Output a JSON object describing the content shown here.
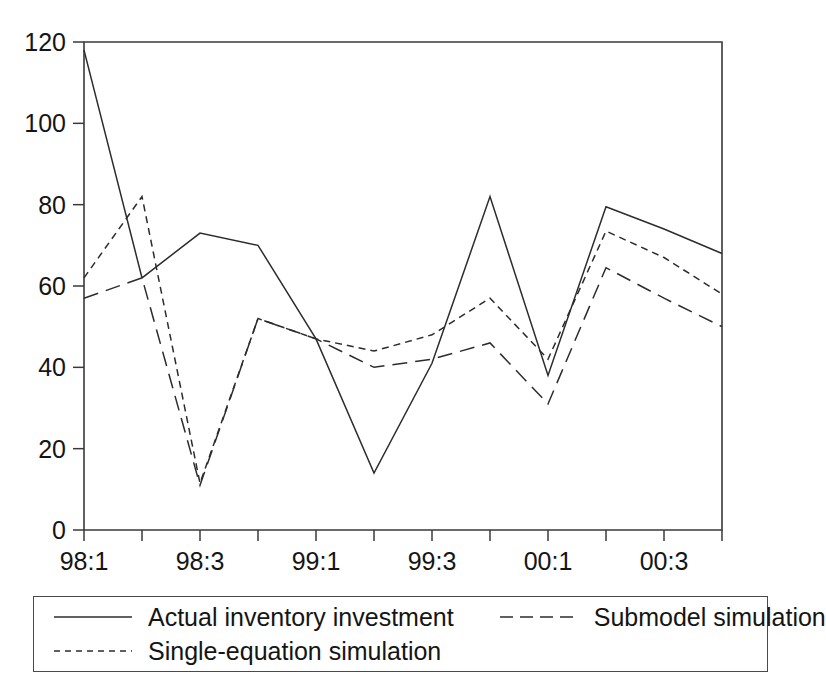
{
  "chart_data": {
    "type": "line",
    "title": "",
    "subtitle": "",
    "xlabel": "",
    "ylabel": "",
    "categories": [
      "98:1",
      "98:2",
      "98:3",
      "98:4",
      "99:1",
      "99:2",
      "99:3",
      "99:4",
      "00:1",
      "00:2",
      "00:3",
      "00:4"
    ],
    "x_tick_labels": [
      "98:1",
      "98:3",
      "99:1",
      "99:3",
      "00:1",
      "00:3"
    ],
    "x_tick_label_indices": [
      0,
      2,
      4,
      6,
      8,
      10
    ],
    "y_tick_labels": [
      "0",
      "20",
      "40",
      "60",
      "80",
      "100",
      "120"
    ],
    "y_ticks": [
      0,
      20,
      40,
      60,
      80,
      100,
      120
    ],
    "ylim": [
      0,
      120
    ],
    "grid": false,
    "legend_position": "below",
    "series": [
      {
        "name": "Actual inventory investment",
        "style": "solid",
        "values": [
          118,
          62,
          73,
          70,
          47,
          14,
          41,
          82,
          38,
          79.5,
          74,
          68
        ]
      },
      {
        "name": "Single-equation simulation",
        "style": "short-dash",
        "values": [
          62,
          82,
          11.5,
          52,
          47,
          44,
          48,
          57,
          42,
          73.5,
          67,
          58
        ]
      },
      {
        "name": "Submodel simulation",
        "style": "long-dash",
        "values": [
          57,
          62,
          11,
          52,
          47,
          40,
          42,
          46,
          31,
          64.5,
          57,
          50
        ]
      }
    ]
  },
  "legend": {
    "entries": [
      {
        "label": "Actual inventory investment",
        "style": "solid"
      },
      {
        "label": "Submodel simulation",
        "style": "long-dash"
      },
      {
        "label": "Single-equation simulation",
        "style": "short-dash"
      }
    ]
  },
  "colors": {
    "line": "#2c2c2c",
    "axis": "#3a3a3a",
    "text": "#151515",
    "background": "#ffffff"
  }
}
